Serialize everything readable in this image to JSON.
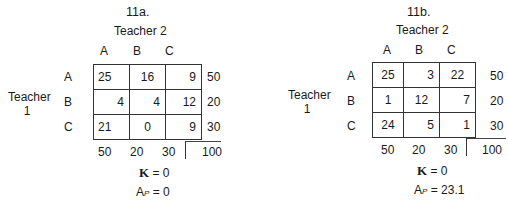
{
  "tables": [
    {
      "label": "11a.",
      "col_header": "Teacher 2",
      "row_header_line1": "Teacher",
      "row_header_line2": "1",
      "col_labels": [
        "A",
        "B",
        "C"
      ],
      "row_labels": [
        "A",
        "B",
        "C"
      ],
      "cells": [
        [
          25,
          16,
          9
        ],
        [
          4,
          4,
          12
        ],
        [
          21,
          0,
          9
        ]
      ],
      "row_totals": [
        50,
        20,
        30
      ],
      "col_totals": [
        50,
        20,
        30
      ],
      "grand_total": 100,
      "kappa_label": "K",
      "kappa_value": "= 0",
      "ap_label": "A",
      "ap_sub": "P",
      "ap_value": "= 0"
    },
    {
      "label": "11b.",
      "col_header": "Teacher 2",
      "row_header_line1": "Teacher",
      "row_header_line2": "1",
      "col_labels": [
        "A",
        "B",
        "C"
      ],
      "row_labels": [
        "A",
        "B",
        "C"
      ],
      "cells": [
        [
          25,
          3,
          22
        ],
        [
          1,
          12,
          7
        ],
        [
          24,
          5,
          1
        ]
      ],
      "row_totals": [
        50,
        20,
        30
      ],
      "col_totals": [
        50,
        20,
        30
      ],
      "grand_total": 100,
      "kappa_label": "K",
      "kappa_value": "= 0",
      "ap_label": "A",
      "ap_sub": "P",
      "ap_value": "= 23.1"
    }
  ]
}
